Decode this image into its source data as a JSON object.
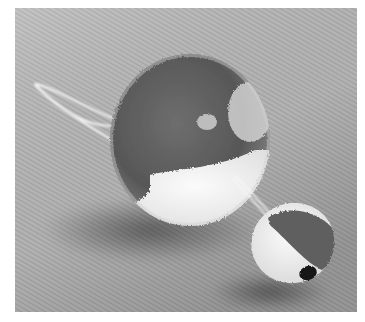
{
  "image": {
    "description": "Black-and-white photograph of two pom-poms with attached yarn strings resting on a twill fabric surface",
    "subjects": [
      {
        "name": "large-pompom",
        "tones": [
          "dark gray top",
          "white bottom"
        ]
      },
      {
        "name": "small-pompom",
        "tones": [
          "dark gray top",
          "white front",
          "black nose"
        ]
      }
    ],
    "colors": {
      "background": "#b9b9b9",
      "background_shadow": "#8f8f8f",
      "pompom_dark": "#5a5a5a",
      "pompom_light": "#efefef",
      "nose": "#151515",
      "string": "#f4f4f4",
      "border": "#ffffff"
    }
  }
}
